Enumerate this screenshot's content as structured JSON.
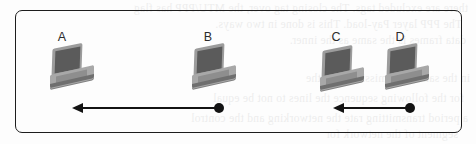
{
  "figure": {
    "type": "network-topology-diagram",
    "border_color": "#1d1d1d",
    "background_color": "#fdfdfd",
    "accent_color": "#131313"
  },
  "nodes": [
    {
      "id": "A",
      "label": "A",
      "icon": "laptop-icon",
      "x": 62,
      "y": 30,
      "laptop_x": 50,
      "laptop_y": 46
    },
    {
      "id": "B",
      "label": "B",
      "icon": "laptop-icon",
      "x": 198,
      "y": 30,
      "laptop_x": 192,
      "laptop_y": 46
    },
    {
      "id": "C",
      "label": "C",
      "icon": "laptop-icon",
      "x": 325,
      "y": 30,
      "laptop_x": 320,
      "laptop_y": 48
    },
    {
      "id": "D",
      "label": "D",
      "icon": "laptop-icon",
      "x": 389,
      "y": 30,
      "laptop_x": 385,
      "laptop_y": 46
    }
  ],
  "arrows": [
    {
      "id": "arrow-b-to-a",
      "from": "B",
      "to": "A",
      "direction": "left",
      "left": 72,
      "top": 102,
      "width": 152
    },
    {
      "id": "arrow-d-to-c",
      "from": "D",
      "to": "C",
      "direction": "left",
      "left": 333,
      "top": 102,
      "width": 82
    }
  ],
  "bleed_text": {
    "line1": "there are excluded tags. The closing tag over, the MTU/PPP has flag",
    "line2": "The PPP layer Pay-load. This is done in two ways.",
    "line3": "data frames is the same as the inner.",
    "line4": "in the same transmission span the",
    "line5": "for the following sequence the lines to not be equal",
    "line6": "a period transmitting rate the networking and the control",
    "line7": "segment of the network for"
  }
}
